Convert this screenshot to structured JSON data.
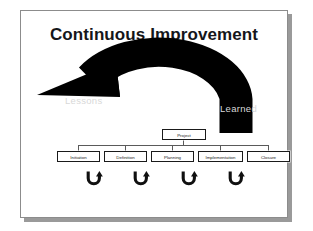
{
  "slide": {
    "title": "Continuous Improvement",
    "background_color": "#ffffff",
    "frame_border_color": "#8c8c8c",
    "shadow_color": "#9a9a9a"
  },
  "feedback_arrow": {
    "icon": "curved-left-arrow",
    "color": "#000000",
    "label_color": "#d8d8d8",
    "label_left": "Lessons",
    "label_right": "Learned"
  },
  "org_chart": {
    "root": {
      "label": "Project"
    },
    "phases": [
      {
        "label": "Initiation"
      },
      {
        "label": "Definition"
      },
      {
        "label": "Planning"
      },
      {
        "label": "Implementation"
      },
      {
        "label": "Closure"
      }
    ],
    "box_border_color": "#1a1a1a",
    "connector_color": "#5a5a5a"
  },
  "transition_arrows": {
    "icon": "u-turn-arrow",
    "color": "#101010",
    "count": 4
  }
}
